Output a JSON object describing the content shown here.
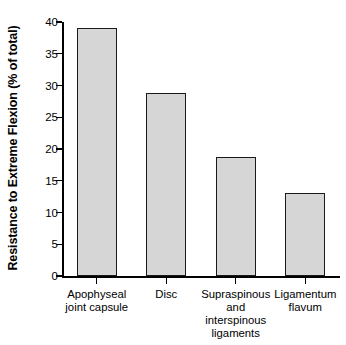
{
  "chart_data": {
    "type": "bar",
    "title": "",
    "xlabel": "",
    "ylabel": "Resistance to Extreme Flexion (% of total)",
    "categories": [
      "Apophyseal\njoint capsule",
      "Disc",
      "Supraspinous\nand\ninterspinous\nligaments",
      "Ligamentum\nflavum"
    ],
    "values": [
      39,
      28.8,
      18.8,
      13
    ],
    "ylim": [
      0,
      40
    ],
    "yticks": [
      "0",
      "5",
      "10",
      "15",
      "20",
      "25",
      "30",
      "35",
      "40"
    ],
    "ytick_values": [
      0,
      5,
      10,
      15,
      20,
      25,
      30,
      35,
      40
    ],
    "grid": false,
    "legend": "none",
    "bar_fill_color": "#d6d6d6",
    "bar_edge_color": "#1a1a1a",
    "axis_color": "#000000",
    "background_color": "#ffffff"
  }
}
